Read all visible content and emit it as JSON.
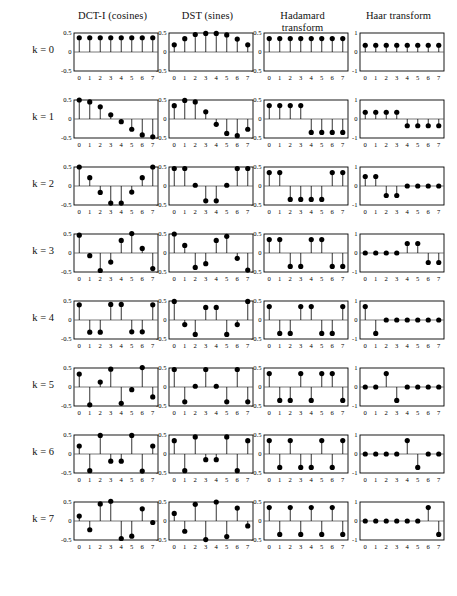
{
  "figure": {
    "title": "",
    "column_headers": [
      {
        "id": "dct",
        "line1": "DCT-I (cosines)",
        "line2": ""
      },
      {
        "id": "dst",
        "line1": "DST (sines)",
        "line2": ""
      },
      {
        "id": "hadamard",
        "line1": "Hadamard",
        "line2": "transform"
      },
      {
        "id": "haar",
        "line1": "Haar transform",
        "line2": ""
      }
    ],
    "row_labels": [
      "k = 0",
      "k = 1",
      "k = 2",
      "k = 3",
      "k = 4",
      "k = 5",
      "k = 6",
      "k = 7"
    ],
    "x_tick_labels": [
      "0",
      "1",
      "2",
      "3",
      "4",
      "5",
      "6",
      "7"
    ],
    "y_tick_labels_half": [
      "0.5",
      "0",
      "-0.5"
    ],
    "y_tick_labels_one": [
      "1",
      "0",
      "-1"
    ],
    "marker_color": "#000000",
    "axis_color": "#000000",
    "baseline_color": "#555555"
  },
  "chart_data": [
    {
      "type": "scatter",
      "id": "dct-k0",
      "title": "DCT-I (cosines)",
      "row": "k = 0",
      "column": "DCT-I (cosines)",
      "xlabel": "",
      "ylabel": "",
      "x": [
        0,
        1,
        2,
        3,
        4,
        5,
        6,
        7
      ],
      "values": [
        0.375,
        0.375,
        0.375,
        0.375,
        0.375,
        0.375,
        0.375,
        0.375
      ],
      "ylim": [
        -0.5,
        0.5
      ],
      "yticks": [
        -0.5,
        0,
        0.5
      ],
      "grid": false,
      "legend": "none"
    },
    {
      "type": "scatter",
      "id": "dct-k1",
      "row": "k = 1",
      "column": "DCT-I (cosines)",
      "x": [
        0,
        1,
        2,
        3,
        4,
        5,
        6,
        7
      ],
      "values": [
        0.5,
        0.45,
        0.32,
        0.11,
        -0.07,
        -0.27,
        -0.42,
        -0.47
      ],
      "ylim": [
        -0.5,
        0.5
      ],
      "yticks": [
        -0.5,
        0,
        0.5
      ]
    },
    {
      "type": "scatter",
      "id": "dct-k2",
      "row": "k = 2",
      "column": "DCT-I (cosines)",
      "x": [
        0,
        1,
        2,
        3,
        4,
        5,
        6,
        7
      ],
      "values": [
        0.5,
        0.22,
        -0.17,
        -0.45,
        -0.45,
        -0.16,
        0.22,
        0.5
      ],
      "ylim": [
        -0.5,
        0.5
      ],
      "yticks": [
        -0.5,
        0,
        0.5
      ]
    },
    {
      "type": "scatter",
      "id": "dct-k3",
      "row": "k = 3",
      "column": "DCT-I (cosines)",
      "x": [
        0,
        1,
        2,
        3,
        4,
        5,
        6,
        7
      ],
      "values": [
        0.47,
        -0.07,
        -0.46,
        -0.24,
        0.33,
        0.51,
        0.12,
        -0.41
      ],
      "ylim": [
        -0.5,
        0.5
      ],
      "yticks": [
        -0.5,
        0,
        0.5
      ]
    },
    {
      "type": "scatter",
      "id": "dct-k4",
      "row": "k = 4",
      "column": "DCT-I (cosines)",
      "x": [
        0,
        1,
        2,
        3,
        4,
        5,
        6,
        7
      ],
      "values": [
        0.4,
        -0.32,
        -0.32,
        0.41,
        0.41,
        -0.31,
        -0.31,
        0.4
      ],
      "ylim": [
        -0.5,
        0.5
      ],
      "yticks": [
        -0.5,
        0,
        0.5
      ]
    },
    {
      "type": "scatter",
      "id": "dct-k5",
      "row": "k = 5",
      "column": "DCT-I (cosines)",
      "x": [
        0,
        1,
        2,
        3,
        4,
        5,
        6,
        7
      ],
      "values": [
        0.34,
        -0.47,
        0.13,
        0.47,
        -0.43,
        -0.07,
        0.51,
        -0.26
      ],
      "ylim": [
        -0.5,
        0.5
      ],
      "yticks": [
        -0.5,
        0,
        0.5
      ]
    },
    {
      "type": "scatter",
      "id": "dct-k6",
      "row": "k = 6",
      "column": "DCT-I (cosines)",
      "x": [
        0,
        1,
        2,
        3,
        4,
        5,
        6,
        7
      ],
      "values": [
        0.21,
        -0.44,
        0.49,
        -0.19,
        -0.19,
        0.49,
        -0.45,
        0.21
      ],
      "ylim": [
        -0.5,
        0.5
      ],
      "yticks": [
        -0.5,
        0,
        0.5
      ]
    },
    {
      "type": "scatter",
      "id": "dct-k7",
      "row": "k = 7",
      "column": "DCT-I (cosines)",
      "x": [
        0,
        1,
        2,
        3,
        4,
        5,
        6,
        7
      ],
      "values": [
        0.13,
        -0.23,
        0.45,
        0.52,
        -0.46,
        -0.4,
        0.32,
        -0.04
      ],
      "ylim": [
        -0.5,
        0.5
      ],
      "yticks": [
        -0.5,
        0,
        0.5
      ]
    },
    {
      "type": "scatter",
      "id": "dst-k0",
      "row": "k = 0",
      "column": "DST (sines)",
      "x": [
        0,
        1,
        2,
        3,
        4,
        5,
        6,
        7
      ],
      "values": [
        0.19,
        0.35,
        0.46,
        0.49,
        0.49,
        0.45,
        0.34,
        0.19
      ],
      "ylim": [
        -0.5,
        0.5
      ],
      "yticks": [
        -0.5,
        0,
        0.5
      ]
    },
    {
      "type": "scatter",
      "id": "dst-k1",
      "row": "k = 1",
      "column": "DST (sines)",
      "x": [
        0,
        1,
        2,
        3,
        4,
        5,
        6,
        7
      ],
      "values": [
        0.35,
        0.49,
        0.45,
        0.19,
        -0.14,
        -0.38,
        -0.44,
        -0.27
      ],
      "ylim": [
        -0.5,
        0.5
      ],
      "yticks": [
        -0.5,
        0,
        0.5
      ]
    },
    {
      "type": "scatter",
      "id": "dst-k2",
      "row": "k = 2",
      "column": "DST (sines)",
      "x": [
        0,
        1,
        2,
        3,
        4,
        5,
        6,
        7
      ],
      "values": [
        0.46,
        0.46,
        0.02,
        -0.39,
        -0.39,
        0.02,
        0.46,
        0.46
      ],
      "ylim": [
        -0.5,
        0.5
      ],
      "yticks": [
        -0.5,
        0,
        0.5
      ]
    },
    {
      "type": "scatter",
      "id": "dst-k3",
      "row": "k = 3",
      "column": "DST (sines)",
      "x": [
        0,
        1,
        2,
        3,
        4,
        5,
        6,
        7
      ],
      "values": [
        0.5,
        0.2,
        -0.38,
        -0.28,
        0.33,
        0.44,
        -0.14,
        -0.45
      ],
      "ylim": [
        -0.5,
        0.5
      ],
      "yticks": [
        -0.5,
        0,
        0.5
      ]
    },
    {
      "type": "scatter",
      "id": "dst-k4",
      "row": "k = 4",
      "column": "DST (sines)",
      "x": [
        0,
        1,
        2,
        3,
        4,
        5,
        6,
        7
      ],
      "values": [
        0.49,
        -0.12,
        -0.38,
        0.33,
        0.33,
        -0.38,
        -0.12,
        0.49
      ],
      "ylim": [
        -0.5,
        0.5
      ],
      "yticks": [
        -0.5,
        0,
        0.5
      ]
    },
    {
      "type": "scatter",
      "id": "dst-k5",
      "row": "k = 5",
      "column": "DST (sines)",
      "x": [
        0,
        1,
        2,
        3,
        4,
        5,
        6,
        7
      ],
      "values": [
        0.46,
        -0.39,
        0.02,
        0.46,
        0.02,
        -0.39,
        0.46,
        -0.39
      ],
      "ylim": [
        -0.5,
        0.5
      ],
      "yticks": [
        -0.5,
        0,
        0.5
      ]
    },
    {
      "type": "scatter",
      "id": "dst-k6",
      "row": "k = 6",
      "column": "DST (sines)",
      "x": [
        0,
        1,
        2,
        3,
        4,
        5,
        6,
        7
      ],
      "values": [
        0.35,
        -0.44,
        0.45,
        -0.15,
        -0.15,
        0.45,
        -0.44,
        0.35
      ],
      "ylim": [
        -0.5,
        0.5
      ],
      "yticks": [
        -0.5,
        0,
        0.5
      ]
    },
    {
      "type": "scatter",
      "id": "dst-k7",
      "row": "k = 7",
      "column": "DST (sines)",
      "x": [
        0,
        1,
        2,
        3,
        4,
        5,
        6,
        7
      ],
      "values": [
        0.2,
        -0.27,
        0.44,
        -0.49,
        0.5,
        -0.41,
        0.34,
        -0.13
      ],
      "ylim": [
        -0.5,
        0.5
      ],
      "yticks": [
        -0.5,
        0,
        0.5
      ]
    },
    {
      "type": "scatter",
      "id": "hadamard-k0",
      "row": "k = 0",
      "column": "Hadamard transform",
      "x": [
        0,
        1,
        2,
        3,
        4,
        5,
        6,
        7
      ],
      "values": [
        0.354,
        0.354,
        0.354,
        0.354,
        0.354,
        0.354,
        0.354,
        0.354
      ],
      "ylim": [
        -0.5,
        0.5
      ],
      "yticks": [
        -0.5,
        0,
        0.5
      ]
    },
    {
      "type": "scatter",
      "id": "hadamard-k1",
      "row": "k = 1",
      "column": "Hadamard transform",
      "x": [
        0,
        1,
        2,
        3,
        4,
        5,
        6,
        7
      ],
      "values": [
        0.354,
        0.354,
        0.354,
        0.354,
        -0.354,
        -0.354,
        -0.354,
        -0.354
      ],
      "ylim": [
        -0.5,
        0.5
      ],
      "yticks": [
        -0.5,
        0,
        0.5
      ]
    },
    {
      "type": "scatter",
      "id": "hadamard-k2",
      "row": "k = 2",
      "column": "Hadamard transform",
      "x": [
        0,
        1,
        2,
        3,
        4,
        5,
        6,
        7
      ],
      "values": [
        0.354,
        0.354,
        -0.354,
        -0.354,
        -0.354,
        -0.354,
        0.354,
        0.354
      ],
      "ylim": [
        -0.5,
        0.5
      ],
      "yticks": [
        -0.5,
        0,
        0.5
      ]
    },
    {
      "type": "scatter",
      "id": "hadamard-k3",
      "row": "k = 3",
      "column": "Hadamard transform",
      "x": [
        0,
        1,
        2,
        3,
        4,
        5,
        6,
        7
      ],
      "values": [
        0.354,
        0.354,
        -0.354,
        -0.354,
        0.354,
        0.354,
        -0.354,
        -0.354
      ],
      "ylim": [
        -0.5,
        0.5
      ],
      "yticks": [
        -0.5,
        0,
        0.5
      ]
    },
    {
      "type": "scatter",
      "id": "hadamard-k4",
      "row": "k = 4",
      "column": "Hadamard transform",
      "x": [
        0,
        1,
        2,
        3,
        4,
        5,
        6,
        7
      ],
      "values": [
        0.354,
        -0.354,
        -0.354,
        0.354,
        0.354,
        -0.354,
        -0.354,
        0.354
      ],
      "ylim": [
        -0.5,
        0.5
      ],
      "yticks": [
        -0.5,
        0,
        0.5
      ]
    },
    {
      "type": "scatter",
      "id": "hadamard-k5",
      "row": "k = 5",
      "column": "Hadamard transform",
      "x": [
        0,
        1,
        2,
        3,
        4,
        5,
        6,
        7
      ],
      "values": [
        0.354,
        -0.354,
        -0.354,
        0.354,
        -0.354,
        0.354,
        0.354,
        -0.354
      ],
      "ylim": [
        -0.5,
        0.5
      ],
      "yticks": [
        -0.5,
        0,
        0.5
      ]
    },
    {
      "type": "scatter",
      "id": "hadamard-k6",
      "row": "k = 6",
      "column": "Hadamard transform",
      "x": [
        0,
        1,
        2,
        3,
        4,
        5,
        6,
        7
      ],
      "values": [
        0.354,
        -0.354,
        0.354,
        -0.354,
        -0.354,
        0.354,
        -0.354,
        0.354
      ],
      "ylim": [
        -0.5,
        0.5
      ],
      "yticks": [
        -0.5,
        0,
        0.5
      ]
    },
    {
      "type": "scatter",
      "id": "hadamard-k7",
      "row": "k = 7",
      "column": "Hadamard transform",
      "x": [
        0,
        1,
        2,
        3,
        4,
        5,
        6,
        7
      ],
      "values": [
        0.354,
        -0.354,
        0.354,
        -0.354,
        0.354,
        -0.354,
        0.354,
        -0.354
      ],
      "ylim": [
        -0.5,
        0.5
      ],
      "yticks": [
        -0.5,
        0,
        0.5
      ]
    },
    {
      "type": "scatter",
      "id": "haar-k0",
      "row": "k = 0",
      "column": "Haar transform",
      "x": [
        0,
        1,
        2,
        3,
        4,
        5,
        6,
        7
      ],
      "values": [
        0.354,
        0.354,
        0.354,
        0.354,
        0.354,
        0.354,
        0.354,
        0.354
      ],
      "ylim": [
        -1,
        1
      ],
      "yticks": [
        -1,
        0,
        1
      ]
    },
    {
      "type": "scatter",
      "id": "haar-k1",
      "row": "k = 1",
      "column": "Haar transform",
      "x": [
        0,
        1,
        2,
        3,
        4,
        5,
        6,
        7
      ],
      "values": [
        0.354,
        0.354,
        0.354,
        0.354,
        -0.354,
        -0.354,
        -0.354,
        -0.354
      ],
      "ylim": [
        -1,
        1
      ],
      "yticks": [
        -1,
        0,
        1
      ]
    },
    {
      "type": "scatter",
      "id": "haar-k2",
      "row": "k = 2",
      "column": "Haar transform",
      "x": [
        0,
        1,
        2,
        3,
        4,
        5,
        6,
        7
      ],
      "values": [
        0.5,
        0.5,
        -0.5,
        -0.5,
        0,
        0,
        0,
        0
      ],
      "ylim": [
        -1,
        1
      ],
      "yticks": [
        -1,
        0,
        1
      ]
    },
    {
      "type": "scatter",
      "id": "haar-k3",
      "row": "k = 3",
      "column": "Haar transform",
      "x": [
        0,
        1,
        2,
        3,
        4,
        5,
        6,
        7
      ],
      "values": [
        0,
        0,
        0,
        0,
        0.5,
        0.5,
        -0.5,
        -0.5
      ],
      "ylim": [
        -1,
        1
      ],
      "yticks": [
        -1,
        0,
        1
      ]
    },
    {
      "type": "scatter",
      "id": "haar-k4",
      "row": "k = 4",
      "column": "Haar transform",
      "x": [
        0,
        1,
        2,
        3,
        4,
        5,
        6,
        7
      ],
      "values": [
        0.707,
        -0.707,
        0,
        0,
        0,
        0,
        0,
        0
      ],
      "ylim": [
        -1,
        1
      ],
      "yticks": [
        -1,
        0,
        1
      ]
    },
    {
      "type": "scatter",
      "id": "haar-k5",
      "row": "k = 5",
      "column": "Haar transform",
      "x": [
        0,
        1,
        2,
        3,
        4,
        5,
        6,
        7
      ],
      "values": [
        0,
        0,
        0.707,
        -0.707,
        0,
        0,
        0,
        0
      ],
      "ylim": [
        -1,
        1
      ],
      "yticks": [
        -1,
        0,
        1
      ]
    },
    {
      "type": "scatter",
      "id": "haar-k6",
      "row": "k = 6",
      "column": "Haar transform",
      "x": [
        0,
        1,
        2,
        3,
        4,
        5,
        6,
        7
      ],
      "values": [
        0,
        0,
        0,
        0,
        0.707,
        -0.707,
        0,
        0
      ],
      "ylim": [
        -1,
        1
      ],
      "yticks": [
        -1,
        0,
        1
      ]
    },
    {
      "type": "scatter",
      "id": "haar-k7",
      "row": "k = 7",
      "column": "Haar transform",
      "x": [
        0,
        1,
        2,
        3,
        4,
        5,
        6,
        7
      ],
      "values": [
        0,
        0,
        0,
        0,
        0,
        0,
        0.707,
        -0.707
      ],
      "ylim": [
        -1,
        1
      ],
      "yticks": [
        -1,
        0,
        1
      ]
    }
  ]
}
